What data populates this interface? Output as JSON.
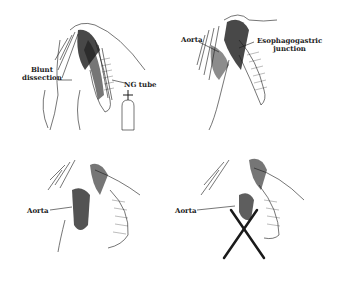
{
  "figure": {
    "panels": [
      {
        "id": "top-left",
        "labels": {
          "blunt_dissection": "Blunt\ndissection",
          "ng_tube": "NG tube"
        },
        "blunt_line1": "Blunt",
        "blunt_line2": "dissection"
      },
      {
        "id": "top-right",
        "labels": {
          "aorta": "Aorta",
          "ej_line1": "Esophagogastric",
          "ej_line2": "junction"
        }
      },
      {
        "id": "bottom-left",
        "labels": {
          "aorta": "Aorta"
        }
      },
      {
        "id": "bottom-right",
        "labels": {
          "aorta": "Aorta"
        }
      }
    ],
    "colors": {
      "ink": "#1a1a1a",
      "background": "#ffffff"
    }
  }
}
